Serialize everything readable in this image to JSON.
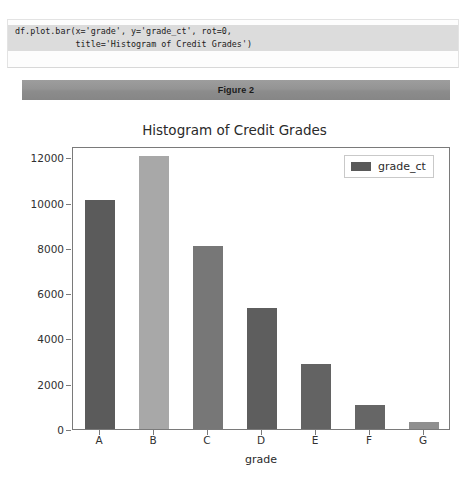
{
  "code_cell": {
    "line1": "df.plot.bar(x='grade', y='grade_ct', rot=0,",
    "line2": "            title='Histogram of Credit Grades')"
  },
  "figure_banner": {
    "label": "Figure 2"
  },
  "chart_data": {
    "type": "bar",
    "title": "Histogram of Credit Grades",
    "xlabel": "grade",
    "ylabel": "",
    "categories": [
      "A",
      "B",
      "C",
      "D",
      "E",
      "F",
      "G"
    ],
    "values": [
      10100,
      12050,
      8100,
      5350,
      2880,
      1060,
      310
    ],
    "series": [
      {
        "name": "grade_ct",
        "values": [
          10100,
          12050,
          8100,
          5350,
          2880,
          1060,
          310
        ]
      }
    ],
    "yticks": [
      0,
      2000,
      4000,
      6000,
      8000,
      10000,
      12000
    ],
    "ytick_labels": [
      "0",
      "2000",
      "4000",
      "6000",
      "8000",
      "10000",
      "12000"
    ],
    "ylim": [
      0,
      12500
    ],
    "grid": false,
    "legend_position": "upper right",
    "legend_entries": [
      "grade_ct"
    ],
    "bar_colors": [
      "#5b5b5b",
      "#a8a8a8",
      "#777777",
      "#5e5e5e",
      "#636363",
      "#666666",
      "#8f8f8f"
    ],
    "accent_color": "#595959"
  }
}
